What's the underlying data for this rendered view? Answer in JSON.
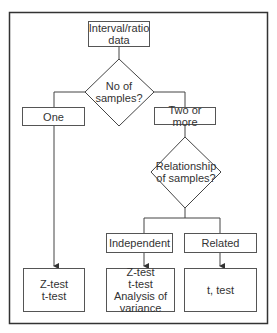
{
  "diagram": {
    "type": "flowchart",
    "nodes": {
      "start": {
        "line1": "Interval/ratio",
        "line2": "data"
      },
      "decision1": {
        "line1": "No of",
        "line2": "samples?"
      },
      "one": {
        "label": "One"
      },
      "two_or_more": {
        "label": "Two or more"
      },
      "decision2": {
        "line1": "Relationship",
        "line2": "of samples?"
      },
      "independent": {
        "label": "Independent"
      },
      "related": {
        "label": "Related"
      },
      "result_one": {
        "line1": "Z-test",
        "line2": "t-test"
      },
      "result_independent": {
        "line1": "Z-test",
        "line2": "t-test",
        "line3": "Analysis of",
        "line4": "variance"
      },
      "result_related": {
        "label": "t, test"
      }
    },
    "edges": [
      [
        "start",
        "decision1"
      ],
      [
        "decision1",
        "one"
      ],
      [
        "decision1",
        "two_or_more"
      ],
      [
        "one",
        "result_one"
      ],
      [
        "two_or_more",
        "decision2"
      ],
      [
        "decision2",
        "independent"
      ],
      [
        "decision2",
        "related"
      ],
      [
        "independent",
        "result_independent"
      ],
      [
        "related",
        "result_related"
      ]
    ],
    "colors": {
      "line": "#444444",
      "background": "#ffffff"
    }
  }
}
